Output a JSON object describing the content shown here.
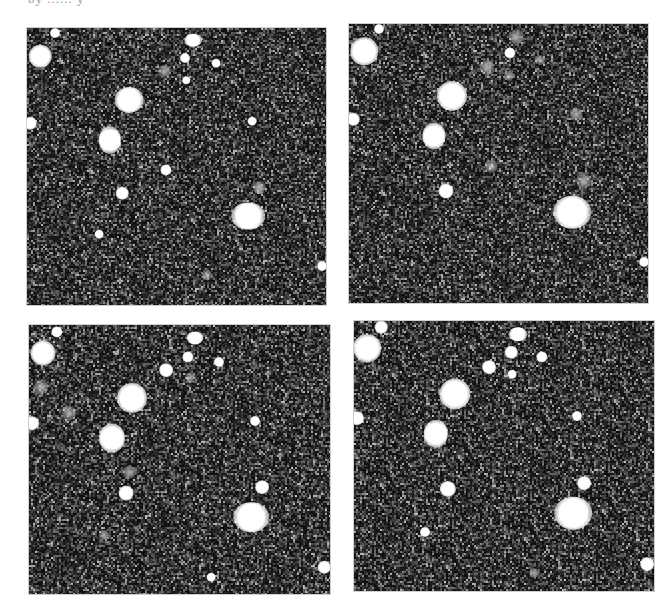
{
  "figure": {
    "caption_fragment": "by ...... y",
    "background_color": "#ffffff",
    "sky_color": "#161616"
  },
  "panels": [
    {
      "id": "top-left",
      "rect": {
        "x": 27,
        "y": 28,
        "w": 299,
        "h": 277
      },
      "stars": [
        {
          "x": 13,
          "y": 28,
          "r": 9
        },
        {
          "x": 28,
          "y": 5,
          "r": 4
        },
        {
          "x": 166,
          "y": 12,
          "r": 6,
          "e": 1.4
        },
        {
          "x": 158,
          "y": 30,
          "r": 4
        },
        {
          "x": 189,
          "y": 35,
          "r": 3.5
        },
        {
          "x": 137,
          "y": 43,
          "r": 5,
          "faint": true
        },
        {
          "x": 159,
          "y": 52,
          "r": 3
        },
        {
          "x": 102,
          "y": 72,
          "r": 11,
          "e": 1.1
        },
        {
          "x": 3,
          "y": 95,
          "r": 5
        },
        {
          "x": 225,
          "y": 93,
          "r": 3.5
        },
        {
          "x": 83,
          "y": 112,
          "r": 10,
          "e": 0.8
        },
        {
          "x": 139,
          "y": 142,
          "r": 4.5
        },
        {
          "x": 95,
          "y": 165,
          "r": 5
        },
        {
          "x": 232,
          "y": 159,
          "r": 5,
          "faint": true
        },
        {
          "x": 221,
          "y": 188,
          "r": 12,
          "e": 1.25
        },
        {
          "x": 72,
          "y": 206,
          "r": 3.5
        },
        {
          "x": 295,
          "y": 238,
          "r": 4
        },
        {
          "x": 180,
          "y": 247,
          "r": 4,
          "faint": true
        }
      ]
    },
    {
      "id": "top-right",
      "rect": {
        "x": 349,
        "y": 24,
        "w": 299,
        "h": 279
      },
      "stars": [
        {
          "x": 15,
          "y": 27,
          "r": 11
        },
        {
          "x": 30,
          "y": 5,
          "r": 4
        },
        {
          "x": 167,
          "y": 13,
          "r": 6,
          "faint": true
        },
        {
          "x": 161,
          "y": 29,
          "r": 4.5
        },
        {
          "x": 191,
          "y": 36,
          "r": 4,
          "faint": true
        },
        {
          "x": 138,
          "y": 43,
          "r": 6,
          "faint": true
        },
        {
          "x": 160,
          "y": 52,
          "r": 4,
          "faint": true
        },
        {
          "x": 103,
          "y": 72,
          "r": 12
        },
        {
          "x": 4,
          "y": 95,
          "r": 5
        },
        {
          "x": 227,
          "y": 90,
          "r": 5,
          "faint": true
        },
        {
          "x": 85,
          "y": 112,
          "r": 10,
          "e": 0.85
        },
        {
          "x": 142,
          "y": 142,
          "r": 5,
          "faint": true
        },
        {
          "x": 97,
          "y": 167,
          "r": 6
        },
        {
          "x": 235,
          "y": 157,
          "r": 6,
          "faint": true
        },
        {
          "x": 223,
          "y": 188,
          "r": 14,
          "e": 1.15
        },
        {
          "x": 295,
          "y": 238,
          "r": 4
        }
      ]
    },
    {
      "id": "bottom-left",
      "rect": {
        "x": 29,
        "y": 325,
        "w": 301,
        "h": 269
      },
      "stars": [
        {
          "x": 14,
          "y": 28,
          "r": 10
        },
        {
          "x": 28,
          "y": 7,
          "r": 4.5
        },
        {
          "x": 166,
          "y": 13,
          "r": 6,
          "e": 1.3
        },
        {
          "x": 159,
          "y": 32,
          "r": 4.5
        },
        {
          "x": 190,
          "y": 37,
          "r": 4
        },
        {
          "x": 137,
          "y": 45,
          "r": 5.5
        },
        {
          "x": 161,
          "y": 53,
          "r": 4,
          "faint": true
        },
        {
          "x": 103,
          "y": 73,
          "r": 12
        },
        {
          "x": 3,
          "y": 98,
          "r": 5.5
        },
        {
          "x": 40,
          "y": 88,
          "r": 6,
          "faint": true
        },
        {
          "x": 12,
          "y": 62,
          "r": 6,
          "faint": true
        },
        {
          "x": 226,
          "y": 96,
          "r": 4
        },
        {
          "x": 83,
          "y": 113,
          "r": 11,
          "e": 0.9
        },
        {
          "x": 100,
          "y": 147,
          "r": 5,
          "faint": true
        },
        {
          "x": 97,
          "y": 168,
          "r": 6
        },
        {
          "x": 233,
          "y": 162,
          "r": 5.5
        },
        {
          "x": 222,
          "y": 192,
          "r": 13,
          "e": 1.2
        },
        {
          "x": 75,
          "y": 210,
          "r": 4,
          "faint": true
        },
        {
          "x": 295,
          "y": 242,
          "r": 5
        },
        {
          "x": 182,
          "y": 252,
          "r": 3.5
        }
      ]
    },
    {
      "id": "bottom-right",
      "rect": {
        "x": 354,
        "y": 321,
        "w": 300,
        "h": 270
      },
      "stars": [
        {
          "x": 13,
          "y": 27,
          "r": 11
        },
        {
          "x": 27,
          "y": 6,
          "r": 5
        },
        {
          "x": 164,
          "y": 13,
          "r": 6.5,
          "e": 1.4
        },
        {
          "x": 157,
          "y": 31,
          "r": 5
        },
        {
          "x": 188,
          "y": 36,
          "r": 4.5
        },
        {
          "x": 135,
          "y": 46,
          "r": 5.5
        },
        {
          "x": 158,
          "y": 53,
          "r": 3.5
        },
        {
          "x": 101,
          "y": 73,
          "r": 12.5
        },
        {
          "x": 3,
          "y": 97,
          "r": 5.5
        },
        {
          "x": 223,
          "y": 95,
          "r": 4
        },
        {
          "x": 82,
          "y": 113,
          "r": 10.5,
          "e": 0.85
        },
        {
          "x": 94,
          "y": 168,
          "r": 6.5
        },
        {
          "x": 230,
          "y": 162,
          "r": 5.5
        },
        {
          "x": 219,
          "y": 192,
          "r": 14,
          "e": 1.15
        },
        {
          "x": 71,
          "y": 211,
          "r": 4
        },
        {
          "x": 293,
          "y": 243,
          "r": 5.5
        },
        {
          "x": 180,
          "y": 252,
          "r": 4,
          "faint": true
        }
      ]
    }
  ]
}
